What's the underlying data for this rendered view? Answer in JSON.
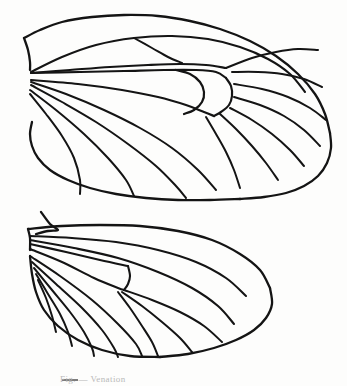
{
  "figure": {
    "background_color": "#fdfdfc",
    "ink_color": "#141414",
    "caption_partial": "Fig.  — Venation",
    "caption_color": "#b9b9b9"
  },
  "parts": [
    {
      "id": "forewing",
      "label": "forewing",
      "region": "upper"
    },
    {
      "id": "hindwing",
      "label": "hindwing",
      "region": "lower"
    }
  ],
  "chart_data": {
    "type": "line",
    "xlabel": "",
    "ylabel": "",
    "xlim": [
      0,
      347
    ],
    "ylim": [
      0,
      386
    ],
    "grid": false,
    "legend": "none",
    "series": [
      {
        "name": "forewing-costal-margin",
        "part": "forewing",
        "role": "margin",
        "stroke_width": 2.3,
        "points": "24,38 40,30 62,22 92,17 124,15 158,16 190,21 220,29 250,41 276,56 298,74 315,94 325,114 330,133"
      },
      {
        "name": "forewing-outer-margin",
        "part": "forewing",
        "role": "margin",
        "stroke_width": 2.3,
        "points": "330,133 331,148 327,163 318,176 304,186 286,193 264,197 240,199"
      },
      {
        "name": "forewing-inner-margin",
        "part": "forewing",
        "role": "margin",
        "stroke_width": 2.3,
        "points": "240,199 210,200 178,200 146,198 116,194 90,188 68,180 50,170 38,158 32,146 30,134 32,122"
      },
      {
        "name": "forewing-base-upper",
        "part": "forewing",
        "role": "margin",
        "stroke_width": 2.3,
        "points": "24,38 28,50 30,62 30,70"
      },
      {
        "name": "forewing-subcosta",
        "part": "forewing",
        "role": "vein",
        "stroke_width": 2.1,
        "points": "31,72 62,57 96,45 134,38 172,36 208,39 240,47 268,59 290,74 305,92"
      },
      {
        "name": "forewing-radius-stem",
        "part": "forewing",
        "role": "vein",
        "stroke_width": 2.1,
        "points": "31,73 70,70 110,67 148,65 180,64 206,65 226,68"
      },
      {
        "name": "forewing-R1",
        "part": "forewing",
        "role": "vein",
        "stroke_width": 2.0,
        "points": "134,38 152,48 168,57 182,63"
      },
      {
        "name": "forewing-R2",
        "part": "forewing",
        "role": "vein",
        "stroke_width": 2.0,
        "points": "226,68 252,58 276,52 298,49 318,50"
      },
      {
        "name": "forewing-R3",
        "part": "forewing",
        "role": "vein",
        "stroke_width": 2.0,
        "points": "232,72 258,72 282,74 304,79 322,87"
      },
      {
        "name": "forewing-R4",
        "part": "forewing",
        "role": "vein",
        "stroke_width": 2.0,
        "points": "234,84 262,89 288,97 310,108 326,120"
      },
      {
        "name": "forewing-R5",
        "part": "forewing",
        "role": "vein",
        "stroke_width": 2.0,
        "points": "234,97 260,105 284,116 304,130 320,146"
      },
      {
        "name": "forewing-M1",
        "part": "forewing",
        "role": "vein",
        "stroke_width": 2.0,
        "points": "230,108 252,120 272,134 290,150 304,166"
      },
      {
        "name": "forewing-M2",
        "part": "forewing",
        "role": "vein",
        "stroke_width": 2.0,
        "points": "220,114 236,129 252,146 266,163 278,180"
      },
      {
        "name": "forewing-M3",
        "part": "forewing",
        "role": "vein",
        "stroke_width": 2.0,
        "points": "206,117 216,134 226,152 234,170 240,188"
      },
      {
        "name": "forewing-cell-top",
        "part": "forewing",
        "role": "cell",
        "stroke_width": 2.2,
        "points": "31,73 80,72 124,71 164,70 196,70 216,72 226,78"
      },
      {
        "name": "forewing-cell-bottom",
        "part": "forewing",
        "role": "cell",
        "stroke_width": 2.2,
        "points": "31,80 78,84 122,90 158,97 186,105 204,112 214,116"
      },
      {
        "name": "forewing-discocellular",
        "part": "forewing",
        "role": "cell",
        "stroke_width": 2.2,
        "points": "226,78 231,86 232,96 229,105 221,112 214,116"
      },
      {
        "name": "forewing-cell-stigma-upper",
        "part": "forewing",
        "role": "cell",
        "stroke_width": 2.2,
        "points": "176,70 190,74 200,82 204,92 202,102 194,110 184,114"
      },
      {
        "name": "forewing-Cu1",
        "part": "forewing",
        "role": "vein",
        "stroke_width": 2.0,
        "points": "31,82 66,94 104,110 140,128 172,148 198,170 216,190"
      },
      {
        "name": "forewing-Cu2",
        "part": "forewing",
        "role": "vein",
        "stroke_width": 2.0,
        "points": "31,85 62,102 96,122 128,144 156,166 176,186 186,198"
      },
      {
        "name": "forewing-A1",
        "part": "forewing",
        "role": "vein",
        "stroke_width": 2.0,
        "points": "30,90 56,110 84,134 108,158 126,180 134,196"
      },
      {
        "name": "forewing-A2",
        "part": "forewing",
        "role": "vein",
        "stroke_width": 2.0,
        "points": "30,94 46,114 62,136 74,158 80,180 80,194"
      },
      {
        "name": "hindwing-costal-margin",
        "part": "hindwing",
        "role": "margin",
        "stroke_width": 2.3,
        "points": "28,229 62,226 100,225 140,226 178,231 212,240 240,254 260,270 270,288"
      },
      {
        "name": "hindwing-outer-margin",
        "part": "hindwing",
        "role": "margin",
        "stroke_width": 2.3,
        "points": "270,288 272,304 266,318 254,330 236,340 214,348 188,354 160,357"
      },
      {
        "name": "hindwing-inner-margin",
        "part": "hindwing",
        "role": "margin",
        "stroke_width": 2.3,
        "points": "160,357 130,356 102,350 78,340 58,326 44,310 36,292 32,274 30,256"
      },
      {
        "name": "hindwing-frenulum-hook",
        "part": "hindwing",
        "role": "frenulum",
        "stroke_width": 2.3,
        "points": "41,212 50,224 58,230 48,231 36,234"
      },
      {
        "name": "hindwing-base-notch",
        "part": "hindwing",
        "role": "margin",
        "stroke_width": 2.3,
        "points": "28,229 30,238 30,250"
      },
      {
        "name": "hindwing-Sc",
        "part": "hindwing",
        "role": "vein",
        "stroke_width": 2.1,
        "points": "30,236 72,238 116,242 158,250 196,262 226,278 246,296"
      },
      {
        "name": "hindwing-Rs",
        "part": "hindwing",
        "role": "vein",
        "stroke_width": 2.1,
        "points": "30,240 74,248 118,258 158,272 192,288 218,306 234,324"
      },
      {
        "name": "hindwing-cell-top",
        "part": "hindwing",
        "role": "cell",
        "stroke_width": 2.1,
        "points": "30,244 66,252 100,260 128,266"
      },
      {
        "name": "hindwing-discocellular",
        "part": "hindwing",
        "role": "cell",
        "stroke_width": 2.1,
        "points": "128,266 130,276 128,284 124,290"
      },
      {
        "name": "hindwing-cell-bottom",
        "part": "hindwing",
        "role": "cell",
        "stroke_width": 2.1,
        "points": "30,249 62,262 94,278 118,288 124,290"
      },
      {
        "name": "hindwing-M1",
        "part": "hindwing",
        "role": "vein",
        "stroke_width": 2.0,
        "points": "124,290 152,300 180,312 204,326 222,342"
      },
      {
        "name": "hindwing-M2",
        "part": "hindwing",
        "role": "vein",
        "stroke_width": 2.0,
        "points": "122,292 142,306 162,322 180,338 192,352"
      },
      {
        "name": "hindwing-M3",
        "part": "hindwing",
        "role": "vein",
        "stroke_width": 2.0,
        "points": "118,292 130,308 142,326 152,342 158,356"
      },
      {
        "name": "hindwing-Cu1",
        "part": "hindwing",
        "role": "vein",
        "stroke_width": 2.0,
        "points": "30,256 60,276 92,300 118,324 136,344 142,356"
      },
      {
        "name": "hindwing-Cu2",
        "part": "hindwing",
        "role": "vein",
        "stroke_width": 2.0,
        "points": "32,262 56,284 82,308 102,330 114,348 118,357"
      },
      {
        "name": "hindwing-A1",
        "part": "hindwing",
        "role": "vein",
        "stroke_width": 2.0,
        "points": "34,268 52,290 70,312 84,332 92,348 94,356"
      },
      {
        "name": "hindwing-A2",
        "part": "hindwing",
        "role": "vein",
        "stroke_width": 2.0,
        "points": "36,274 48,294 60,314 68,332 72,346"
      },
      {
        "name": "hindwing-A3",
        "part": "hindwing",
        "role": "vein",
        "stroke_width": 2.0,
        "points": "38,280 46,298 52,316 56,332"
      }
    ]
  }
}
